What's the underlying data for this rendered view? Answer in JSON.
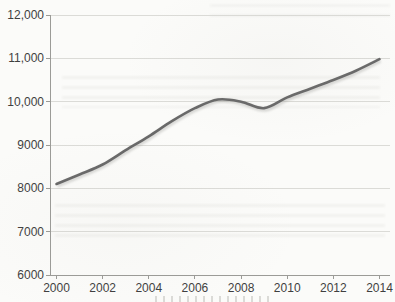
{
  "figure": {
    "background": "#fbfbf9",
    "line_color": "#696969",
    "line_shadow_color": "#9a9a96",
    "grid_color": "#dbdbd7",
    "axis_color": "#9b9b97",
    "tick_color": "#9b9b97",
    "text_color": "#3f3f3f"
  },
  "chart_data": {
    "type": "line",
    "x": [
      2000,
      2001,
      2002,
      2003,
      2004,
      2005,
      2006,
      2007,
      2008,
      2009,
      2010,
      2011,
      2012,
      2013,
      2014
    ],
    "series": [
      {
        "values": [
          8100,
          8320,
          8550,
          8880,
          9200,
          9550,
          9850,
          10050,
          10000,
          9850,
          10100,
          10300,
          10500,
          10720,
          10980
        ]
      }
    ],
    "x_ticks": [
      2000,
      2002,
      2004,
      2006,
      2008,
      2010,
      2012,
      2014
    ],
    "x_tick_labels": [
      "2000",
      "2002",
      "2004",
      "2006",
      "2008",
      "2010",
      "2012",
      "2014"
    ],
    "y_ticks": [
      6000,
      7000,
      8000,
      9000,
      10000,
      11000,
      12000
    ],
    "y_tick_labels": [
      "6000",
      "7000",
      "8000",
      "9000",
      "10,000",
      "11,000",
      "12,000"
    ],
    "xlim": [
      1999.5,
      2014.5
    ],
    "ylim": [
      6000,
      12000
    ],
    "grid": true,
    "legend": false
  }
}
